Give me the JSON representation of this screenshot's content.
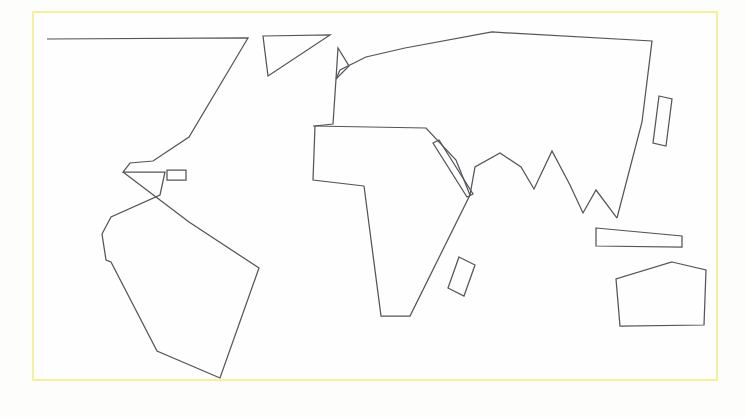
{
  "document": {
    "title": "World Map Outline",
    "kind": "vector-line-drawing",
    "width": 746,
    "height": 417,
    "background_color": "#fdfdfb",
    "canvas_color": "#fefefe"
  },
  "frame": {
    "name": "map-border-frame",
    "color": "#f5ef9e",
    "stroke_width": 2,
    "x": 32,
    "y": 11,
    "width": 686,
    "height": 370
  },
  "style": {
    "stroke_color": "#55545a",
    "stroke_width": 1.25,
    "fill": "none"
  },
  "shapes": [
    {
      "name": "north-america",
      "label": "North America",
      "type": "polyline",
      "closed": false,
      "points": "47,39 248,38 189,137 153,161 130,163 123,172 165,172 160,195 111,217 102,234"
    },
    {
      "name": "greenland",
      "label": "Greenland",
      "type": "polygon",
      "closed": true,
      "points": "263,36 330,35 268,76"
    },
    {
      "name": "scandinavia-spike",
      "label": "Scandinavian Peninsula",
      "type": "polyline",
      "closed": false,
      "points": "336,79 338,48 349,66 336,79"
    },
    {
      "name": "eurasia",
      "label": "Eurasia",
      "type": "polyline",
      "closed": false,
      "points": "336,79 340,70 366,57 405,48 492,32 652,41 642,122 617,218"
    },
    {
      "name": "eurasia-west-coast",
      "label": "Eurasia West Coast",
      "type": "polyline",
      "closed": false,
      "points": "336,79 333,124 315,126 313,180 364,186"
    },
    {
      "name": "africa",
      "label": "Africa",
      "type": "polyline",
      "closed": false,
      "points": "364,186 381,316 410,316 470,195 456,160 426,128 313,126"
    },
    {
      "name": "red-sea-strip",
      "label": "Red Sea Strip",
      "type": "polygon",
      "closed": true,
      "points": "433,143 439,140 473,194 467,197"
    },
    {
      "name": "southern-asia-zigzag",
      "label": "Southern Asia Coastline",
      "type": "polyline",
      "closed": false,
      "points": "470,195 475,167 500,153 521,167 534,189 552,151 570,185 583,213 596,190 617,218"
    },
    {
      "name": "madagascar",
      "label": "Madagascar",
      "type": "polygon",
      "closed": true,
      "points": "459,257 475,265 464,296 448,288"
    },
    {
      "name": "japan",
      "label": "Japan",
      "type": "polygon",
      "closed": true,
      "points": "659,96 672,99 666,146 653,143"
    },
    {
      "name": "indonesia-strip",
      "label": "Indonesia Strip",
      "type": "polygon",
      "closed": true,
      "points": "596,228 682,236 682,247 596,246"
    },
    {
      "name": "australia",
      "label": "Australia",
      "type": "polygon",
      "closed": true,
      "points": "672,262 706,270 704,325 620,326 616,279"
    },
    {
      "name": "caribbean-islet",
      "label": "Caribbean Islet",
      "type": "polygon",
      "closed": true,
      "points": "167,170 186,170 186,180 167,180"
    },
    {
      "name": "south-america",
      "label": "South America",
      "type": "polyline",
      "closed": false,
      "points": "102,234 106,260 111,262 157,351 220,378 259,268 189,222 123,172"
    }
  ]
}
